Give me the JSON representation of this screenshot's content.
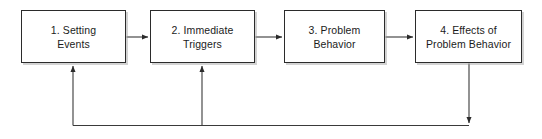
{
  "diagram": {
    "colors": {
      "box_border": "#2b2b2b",
      "box_fill": "#ffffff",
      "text": "#1b1b1b",
      "connector": "#3a3a3a",
      "shadow": "#969696",
      "background": "#ffffff"
    },
    "nodes": [
      {
        "id": "1",
        "label": "1. Setting\nEvents"
      },
      {
        "id": "2",
        "label": "2. Immediate\nTriggers"
      },
      {
        "id": "3",
        "label": "3. Problem\nBehavior"
      },
      {
        "id": "4",
        "label": "4. Effects of\nProblem Behavior"
      }
    ],
    "connectors": [
      {
        "id": "forward-1-2",
        "from": "1. Setting Events",
        "to": "2. Immediate Triggers",
        "direction": "right",
        "style": "solid"
      },
      {
        "id": "forward-2-3",
        "from": "2. Immediate Triggers",
        "to": "3. Problem Behavior",
        "direction": "right",
        "style": "solid"
      },
      {
        "id": "forward-3-4",
        "from": "3. Problem Behavior",
        "to": "4. Effects of Problem Behavior",
        "direction": "right",
        "style": "solid"
      },
      {
        "id": "feedback-4-down",
        "from": "4. Effects of Problem Behavior",
        "to": "feedback bus",
        "direction": "down",
        "style": "solid"
      },
      {
        "id": "feedback-bus-to-1",
        "from": "feedback bus",
        "to": "1. Setting Events",
        "direction": "up",
        "style": "solid"
      },
      {
        "id": "feedback-bus-to-2",
        "from": "feedback bus",
        "to": "2. Immediate Triggers",
        "direction": "up",
        "style": "solid"
      }
    ]
  }
}
